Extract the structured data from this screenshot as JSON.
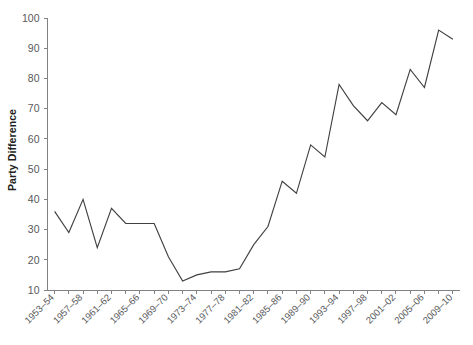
{
  "chart_data": {
    "type": "line",
    "title": "",
    "subtitle": "",
    "xlabel": "",
    "ylabel": "Party Difference",
    "ylim": [
      10,
      100
    ],
    "ytick_values": [
      10,
      20,
      30,
      40,
      50,
      60,
      70,
      80,
      90,
      100
    ],
    "ytick_labels": [
      "10",
      "20",
      "30",
      "40",
      "50",
      "60",
      "70",
      "80",
      "90",
      "100"
    ],
    "grid": false,
    "legend": "none",
    "categories": [
      "1953–54",
      "1955–56",
      "1957–58",
      "1959–60",
      "1961–62",
      "1963–64",
      "1965–66",
      "1967–68",
      "1969–70",
      "1971–72",
      "1973–74",
      "1975–76",
      "1977–78",
      "1979–80",
      "1981–82",
      "1983–84",
      "1985–86",
      "1987–88",
      "1989–90",
      "1991–92",
      "1993–94",
      "1995–96",
      "1997–98",
      "1999–00",
      "2001–02",
      "2003–04",
      "2005–06",
      "2007–08",
      "2009–10"
    ],
    "xtick_labels_shown": [
      "1953–54",
      "1957–58",
      "1961–62",
      "1965–66",
      "1969–70",
      "1973–74",
      "1977–78",
      "1981–82",
      "1985–86",
      "1989–90",
      "1993–94",
      "1997–98",
      "2001–02",
      "2005–06",
      "2009–10"
    ],
    "values": [
      36,
      29,
      40,
      24,
      37,
      32,
      32,
      32,
      21,
      13,
      15,
      16,
      16,
      17,
      25,
      31,
      46,
      42,
      58,
      54,
      78,
      71,
      66,
      72,
      68,
      83,
      77,
      96,
      93
    ],
    "series": [
      {
        "name": "Party Difference",
        "color": "#414042",
        "values": [
          36,
          29,
          40,
          24,
          37,
          32,
          32,
          32,
          21,
          13,
          15,
          16,
          16,
          17,
          25,
          31,
          46,
          42,
          58,
          54,
          78,
          71,
          66,
          72,
          68,
          83,
          77,
          96,
          93
        ]
      }
    ],
    "axis_color": "#808285",
    "text_color": "#58595b",
    "label_color": "#231f20"
  }
}
